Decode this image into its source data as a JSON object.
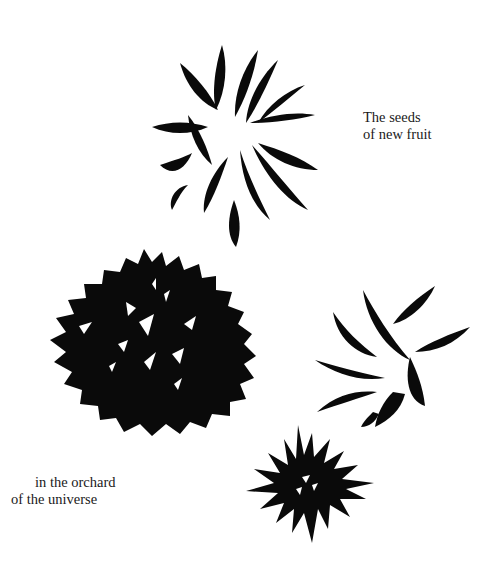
{
  "captions": {
    "top": {
      "line1": "The seeds",
      "line2": "of new fruit"
    },
    "bottom": {
      "line1": "in the orchard",
      "line2": "of the universe"
    }
  },
  "illustrations": [
    {
      "name": "brush-flower-top",
      "description": "spiky ink-brush flower with curved petals"
    },
    {
      "name": "brush-flower-large-round",
      "description": "large dense round ink blot flower with white gaps"
    },
    {
      "name": "brush-flower-right",
      "description": "partial ink-brush flower with diagonal petals"
    },
    {
      "name": "brush-flower-small-spiky",
      "description": "small spiky starburst ink flower"
    }
  ],
  "colors": {
    "ink": "#0a0a0a",
    "background": "#ffffff",
    "text": "#1a1a1a"
  }
}
